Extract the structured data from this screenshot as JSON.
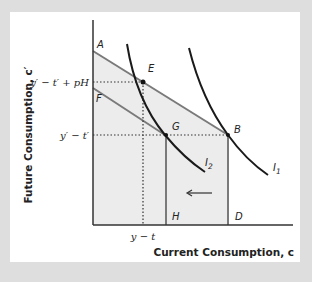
{
  "diagram": {
    "axes": {
      "y_label": "Future Consumption, c′",
      "x_label": "Current Consumption, c"
    },
    "y_ticks": [
      {
        "label": "y′ − t′ + pH"
      },
      {
        "label": "y′ − t′"
      }
    ],
    "x_ticks": [
      {
        "label": "y − t"
      }
    ],
    "points": {
      "A": "A",
      "B": "B",
      "D": "D",
      "E": "E",
      "F": "F",
      "G": "G",
      "H": "H"
    },
    "curves": {
      "I1": {
        "main": "I",
        "sub": "1"
      },
      "I2": {
        "main": "I",
        "sub": "2"
      }
    },
    "colors": {
      "background": "#dedede",
      "panel": "#ffffff",
      "shade": "#ebebeb",
      "budget_line": "#7a7a7a",
      "curve": "#1a1a1a"
    }
  }
}
